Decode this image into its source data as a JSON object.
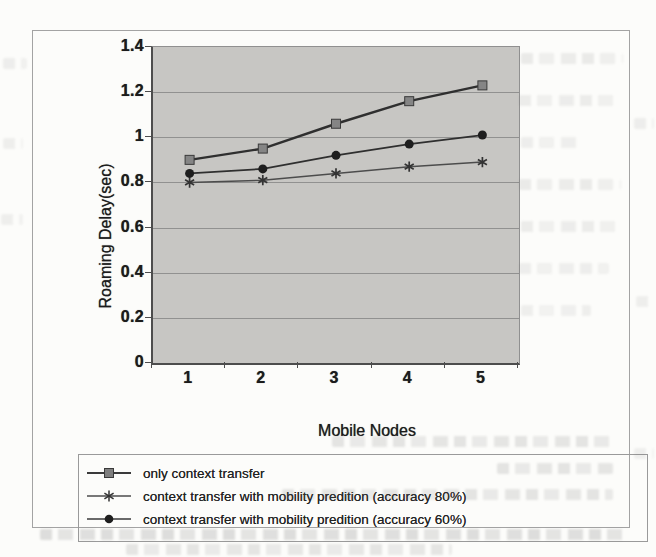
{
  "chart_data": {
    "type": "line",
    "title": "",
    "xlabel": "Mobile Nodes",
    "ylabel": "Roaming Delay(sec)",
    "x_values": [
      1,
      2,
      3,
      4,
      5
    ],
    "xticks": [
      "1",
      "2",
      "3",
      "4",
      "5"
    ],
    "ylim": [
      0,
      1.4
    ],
    "yticks": [
      {
        "label": "1.4",
        "value": 1.4
      },
      {
        "label": "1.2",
        "value": 1.2
      },
      {
        "label": "1",
        "value": 1.0
      },
      {
        "label": "0.8",
        "value": 0.8
      },
      {
        "label": "0.6",
        "value": 0.6
      },
      {
        "label": "0.4",
        "value": 0.4
      },
      {
        "label": "0.2",
        "value": 0.2
      },
      {
        "label": "0",
        "value": 0
      }
    ],
    "gridline_values": [
      1.2,
      1.0,
      0.8,
      0.6,
      0.4,
      0.2
    ],
    "grid": "horizontal",
    "legend_position": "bottom-left-box",
    "plot_bg_color": "#c7c6c3",
    "series": [
      {
        "name": "only context transfer",
        "marker": "square",
        "line_color": "#2f2f2f",
        "line_width": 2.4,
        "marker_color": "#858585",
        "values": [
          0.9,
          0.95,
          1.06,
          1.16,
          1.23
        ]
      },
      {
        "name": "context transfer with mobility predition (accuracy 80%)",
        "marker": "asterisk",
        "line_color": "#4c4c4c",
        "line_width": 1.5,
        "marker_color": "#333333",
        "values": [
          0.8,
          0.81,
          0.84,
          0.87,
          0.89
        ]
      },
      {
        "name": "context transfer with mobility predition (accuracy 60%)",
        "marker": "circle",
        "line_color": "#2f2f2f",
        "line_width": 1.8,
        "marker_color": "#1e1e1e",
        "values": [
          0.84,
          0.86,
          0.92,
          0.97,
          1.01
        ]
      }
    ]
  }
}
